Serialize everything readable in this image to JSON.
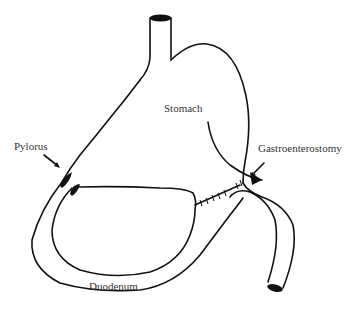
{
  "diagram": {
    "type": "anatomical-line-drawing",
    "stroke_color": "#111111",
    "text_color": "#333333",
    "background": "#ffffff"
  },
  "labels": {
    "stomach": "Stomach",
    "pylorus": "Pylorus",
    "gastroenterostomy": "Gastroenterostomy",
    "duodenum": "Duodenum"
  }
}
